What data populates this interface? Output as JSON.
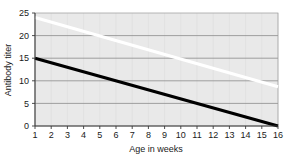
{
  "chart_data": {
    "type": "line",
    "title": "",
    "xlabel": "Age in weeks",
    "ylabel": "Antibody titer",
    "xlim": [
      1,
      16
    ],
    "ylim": [
      0,
      25
    ],
    "grid": true,
    "legend_position": "none",
    "x_ticks": [
      "1",
      "2",
      "3",
      "4",
      "5",
      "6",
      "7",
      "8",
      "9",
      "10",
      "11",
      "12",
      "13",
      "14",
      "15",
      "16"
    ],
    "y_ticks": [
      "0",
      "5",
      "10",
      "15",
      "20",
      "25"
    ],
    "x": [
      1,
      16
    ],
    "series": [
      {
        "name": "white-line",
        "color": "#ffffff",
        "width": 3.2,
        "x": [
          1,
          16
        ],
        "values": [
          24,
          8.7
        ]
      },
      {
        "name": "black-line",
        "color": "#000000",
        "width": 3.2,
        "x": [
          1,
          16
        ],
        "values": [
          15,
          0
        ]
      }
    ]
  }
}
